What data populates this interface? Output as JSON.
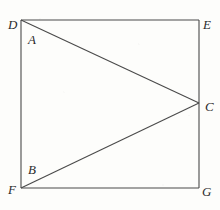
{
  "figure": {
    "background_color": "#fdfdfb",
    "line_color": "#4a4a4a",
    "label_color": "#2b2b2b",
    "line_width": 1,
    "shape": "square with two cevians meeting at a point on the right side",
    "square_label": "DEGF"
  },
  "points": {
    "A": {
      "label": "A",
      "x": 30,
      "y": 41,
      "role": "interior-label-near-D"
    },
    "B": {
      "label": "B",
      "x": 30,
      "y": 172,
      "role": "interior-label-near-F"
    },
    "C": {
      "label": "C",
      "x": 205,
      "y": 107,
      "role": "apex-on-right-edge"
    },
    "D": {
      "label": "D",
      "x": 8,
      "y": 18,
      "role": "top-left-corner"
    },
    "E": {
      "label": "E",
      "x": 203,
      "y": 18,
      "role": "top-right-corner"
    },
    "F": {
      "label": "F",
      "x": 8,
      "y": 190,
      "role": "bottom-left-corner"
    },
    "G": {
      "label": "G",
      "x": 203,
      "y": 190,
      "role": "bottom-right-corner"
    }
  },
  "geometry": {
    "square": {
      "left": 21,
      "top": 20,
      "right": 199,
      "bottom": 188
    },
    "apex": {
      "x": 199,
      "y": 103
    },
    "edges": [
      {
        "name": "DE",
        "x1": 21,
        "y1": 20,
        "x2": 199,
        "y2": 20
      },
      {
        "name": "EG",
        "x1": 199,
        "y1": 20,
        "x2": 199,
        "y2": 188
      },
      {
        "name": "FG",
        "x1": 21,
        "y1": 188,
        "x2": 199,
        "y2": 188
      },
      {
        "name": "DF",
        "x1": 21,
        "y1": 20,
        "x2": 21,
        "y2": 188
      }
    ],
    "cevians": [
      {
        "name": "DC",
        "x1": 21,
        "y1": 20,
        "x2": 199,
        "y2": 103
      },
      {
        "name": "FC",
        "x1": 21,
        "y1": 188,
        "x2": 199,
        "y2": 103
      }
    ]
  }
}
